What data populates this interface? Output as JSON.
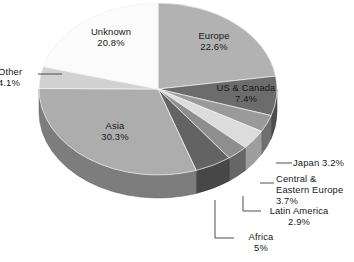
{
  "chart_data": {
    "type": "pie",
    "title": "",
    "subtitle": "",
    "xlabel": "",
    "ylabel": "",
    "legend_position": "none",
    "grid": false,
    "three_d": true,
    "start_angle_deg": 0,
    "direction": "clockwise",
    "labels_show_name_and_percent": true,
    "categories": [
      "Europe",
      "US & Canada",
      "Japan",
      "Central & Eastern Europe",
      "Latin America",
      "Africa",
      "Asia",
      "Other",
      "Unknown"
    ],
    "values": [
      22.6,
      7.4,
      3.2,
      3.7,
      2.9,
      5.0,
      30.3,
      4.1,
      20.8
    ],
    "value_labels": [
      "22.6%",
      "7.4%",
      "3.2%",
      "3.7%",
      "2.9%",
      "5%",
      "30.3%",
      "4.1%",
      "20.8%"
    ],
    "colors": [
      "#b2b2b2",
      "#6c6c6c",
      "#9a9a9a",
      "#dcdcdc",
      "#8e8e8e",
      "#636363",
      "#adadad",
      "#d2d2d2",
      "#fbfbfb"
    ],
    "slices": [
      {
        "name": "Europe",
        "value": 22.6,
        "label": "Europe",
        "percent_text": "22.6%",
        "color": "#b2b2b2",
        "label_placement": "inside"
      },
      {
        "name": "US & Canada",
        "value": 7.4,
        "label": "US & Canada",
        "percent_text": "7.4%",
        "color": "#6c6c6c",
        "label_placement": "inside"
      },
      {
        "name": "Japan",
        "value": 3.2,
        "label": "Japan",
        "percent_text": "3.2%",
        "color": "#9a9a9a",
        "label_placement": "callout"
      },
      {
        "name": "Central & Eastern Europe",
        "value": 3.7,
        "label": "Central & Eastern Europe",
        "percent_text": "3.7%",
        "color": "#dcdcdc",
        "label_placement": "callout"
      },
      {
        "name": "Latin America",
        "value": 2.9,
        "label": "Latin America",
        "percent_text": "2.9%",
        "color": "#8e8e8e",
        "label_placement": "callout"
      },
      {
        "name": "Africa",
        "value": 5.0,
        "label": "Africa",
        "percent_text": "5%",
        "color": "#636363",
        "label_placement": "callout"
      },
      {
        "name": "Asia",
        "value": 30.3,
        "label": "Asia",
        "percent_text": "30.3%",
        "color": "#adadad",
        "label_placement": "inside"
      },
      {
        "name": "Other",
        "value": 4.1,
        "label": "Other",
        "percent_text": "4.1%",
        "color": "#d2d2d2",
        "label_placement": "callout"
      },
      {
        "name": "Unknown",
        "value": 20.8,
        "label": "Unknown",
        "percent_text": "20.8%",
        "color": "#fbfbfb",
        "label_placement": "inside"
      }
    ],
    "total": 100.0
  },
  "labels": {
    "europe": {
      "name": "Europe",
      "percent": "22.6%"
    },
    "unknown": {
      "name": "Unknown",
      "percent": "20.8%"
    },
    "uscanada": {
      "name": "US & Canada",
      "percent": "7.4%"
    },
    "asia": {
      "name": "Asia",
      "percent": "30.3%"
    },
    "other": {
      "name": "Other",
      "percent": "4.1%"
    },
    "japan": {
      "name": "Japan",
      "percent": "3.2%"
    },
    "cee": {
      "name": "Central &",
      "name2": "Eastern Europe",
      "percent": "3.7%"
    },
    "latam": {
      "name": "Latin America",
      "percent": "2.9%"
    },
    "africa": {
      "name": "Africa",
      "percent": "5%"
    }
  }
}
